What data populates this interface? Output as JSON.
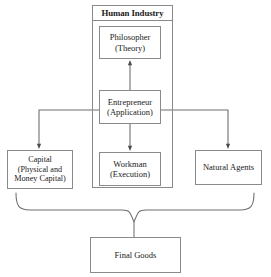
{
  "diagram": {
    "title": "Human Industry",
    "group": {
      "label": "Human Industry",
      "name": "human-industry-group"
    },
    "nodes": [
      {
        "id": "philosopher",
        "lines": [
          "Philosopher",
          "(Theory)"
        ],
        "line1": "Philosopher",
        "line2": "(Theory)",
        "line3": ""
      },
      {
        "id": "entrepreneur",
        "lines": [
          "Entrepreneur",
          "(Application)"
        ],
        "line1": "Entrepreneur",
        "line2": "(Application)",
        "line3": ""
      },
      {
        "id": "workman",
        "lines": [
          "Workman",
          "(Execution)"
        ],
        "line1": "Workman",
        "line2": "(Execution)",
        "line3": ""
      },
      {
        "id": "capital",
        "lines": [
          "Capital",
          "(Physical and",
          "Money Capital)"
        ],
        "line1": "Capital",
        "line2": "(Physical and",
        "line3": "Money Capital)"
      },
      {
        "id": "natural-agents",
        "lines": [
          "Natural Agents"
        ],
        "line1": "Natural Agents",
        "line2": "",
        "line3": ""
      },
      {
        "id": "final-goods",
        "lines": [
          "Final Goods"
        ],
        "line1": "Final Goods",
        "line2": "",
        "line3": ""
      }
    ],
    "edges": [
      {
        "from": "entrepreneur",
        "to": "philosopher",
        "style": "arrow-up"
      },
      {
        "from": "entrepreneur",
        "to": "workman",
        "style": "arrow-down"
      },
      {
        "from": "entrepreneur",
        "to": "capital",
        "style": "elbow-left-arrow-down"
      },
      {
        "from": "entrepreneur",
        "to": "natural-agents",
        "style": "elbow-right-arrow-down"
      },
      {
        "from": "capital,workman,natural-agents",
        "to": "final-goods",
        "style": "curly-brace"
      }
    ],
    "colors": {
      "stroke": "#8a8a8a",
      "edge": "#6f6f6f",
      "text": "#1a1a1a",
      "background": "#ffffff"
    }
  }
}
